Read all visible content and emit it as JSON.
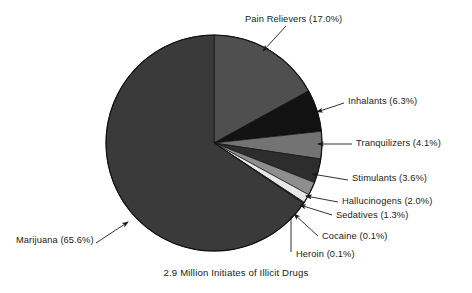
{
  "caption": "2.9 Million Initiates of Illicit Drugs",
  "labels": {
    "pain_relievers": "Pain Relievers (17.0%)",
    "inhalants": "Inhalants (6.3%)",
    "tranquilizers": "Tranquilizers (4.1%)",
    "stimulants": "Stimulants (3.6%)",
    "hallucinogens": "Hallucinogens (2.0%)",
    "sedatives": "Sedatives (1.3%)",
    "cocaine": "Cocaine (0.1%)",
    "heroin": "Heroin (0.1%)",
    "marijuana": "Marijuana (65.6%)"
  },
  "chart_data": {
    "type": "pie",
    "title": "2.9 Million Initiates of Illicit Drugs",
    "xlabel": "",
    "ylabel": "",
    "units": "percent",
    "total_label": "2.9 Million",
    "start_angle_deg": -90,
    "direction": "clockwise",
    "legend_position": "callout-labels",
    "grid": false,
    "categories": [
      "Pain Relievers",
      "Inhalants",
      "Tranquilizers",
      "Stimulants",
      "Hallucinogens",
      "Sedatives",
      "Cocaine",
      "Heroin",
      "Marijuana"
    ],
    "values": [
      17.0,
      6.3,
      4.1,
      3.6,
      2.0,
      1.3,
      0.1,
      0.1,
      65.6
    ],
    "value_labels": [
      "17.0%",
      "6.3%",
      "4.1%",
      "3.6%",
      "2.0%",
      "1.3%",
      "0.1%",
      "0.1%",
      "65.6%"
    ],
    "slice_colors": [
      "#4f4f4f",
      "#121212",
      "#737373",
      "#2d2d2d",
      "#8e8e8e",
      "#e8e8e8",
      "#bdbdbd",
      "#5a5a5a",
      "#3a3a3a"
    ],
    "annotations": [
      "Pain Relievers (17.0%)",
      "Inhalants (6.3%)",
      "Tranquilizers (4.1%)",
      "Stimulants (3.6%)",
      "Hallucinogens (2.0%)",
      "Sedatives (1.3%)",
      "Cocaine (0.1%)",
      "Heroin (0.1%)",
      "Marijuana (65.6%)"
    ]
  },
  "colors": {
    "background": "#ffffff",
    "text": "#1b1b1b",
    "outline": "#0f0f0f",
    "leader": "#1b1b1b"
  }
}
